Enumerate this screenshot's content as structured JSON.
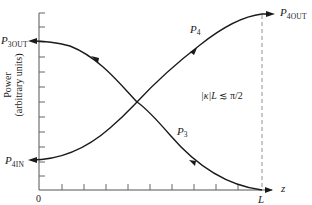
{
  "diagram": {
    "type": "coupled-mode power exchange plot",
    "y_axis": {
      "label_line1": "Power",
      "label_line2": "(arbitrary units)"
    },
    "x_axis": {
      "variable": "z",
      "origin_label": "0",
      "end_label": "L"
    },
    "curves": [
      {
        "name": "P4",
        "label": "P",
        "sub": "4",
        "direction": "increasing"
      },
      {
        "name": "P3",
        "label": "P",
        "sub": "3",
        "direction": "decreasing"
      }
    ],
    "endpoint_labels": {
      "p3_out": {
        "label": "P",
        "sub": "3OUT"
      },
      "p4_in": {
        "label": "P",
        "sub": "4IN"
      },
      "p4_out": {
        "label": "P",
        "sub": "4OUT"
      }
    },
    "condition": {
      "kappa": "|κ|",
      "L": "L",
      "relation": "≲ π/2"
    }
  },
  "colors": {
    "line": "#1a1a1a",
    "axis": "#555555",
    "background": "#ffffff"
  }
}
